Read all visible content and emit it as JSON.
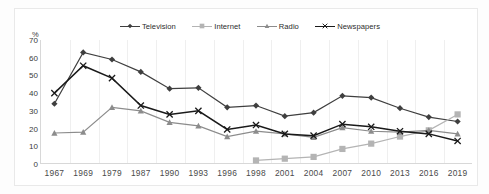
{
  "chart_data": {
    "type": "line",
    "title": "",
    "xlabel": "",
    "ylabel": "%",
    "ylim": [
      0,
      70
    ],
    "yticks": [
      70,
      60,
      50,
      40,
      30,
      20,
      10,
      0
    ],
    "grid": "vertical",
    "legend_position": "top-center",
    "categories": [
      "1967",
      "1969",
      "1979",
      "1987",
      "1990",
      "1993",
      "1996",
      "1998",
      "2001",
      "2004",
      "2007",
      "2010",
      "2013",
      "2016",
      "2019"
    ],
    "series": [
      {
        "name": "Television",
        "color": "#3f3f3f",
        "marker": "diamond",
        "values": [
          34,
          63,
          59,
          52,
          42.5,
          43,
          32,
          33,
          27,
          29,
          38.5,
          37.5,
          31.5,
          26.5,
          24
        ]
      },
      {
        "name": "Internet",
        "color": "#b4b4b4",
        "marker": "square",
        "values": [
          null,
          null,
          null,
          null,
          null,
          null,
          null,
          2,
          3,
          4,
          8.5,
          11.5,
          15.5,
          19,
          28
        ]
      },
      {
        "name": "Radio",
        "color": "#8c8c8c",
        "marker": "triangle",
        "values": [
          17.5,
          18,
          32,
          30,
          23.5,
          21.5,
          15.5,
          18.5,
          17,
          15,
          20.5,
          18.5,
          18,
          19,
          17
        ]
      },
      {
        "name": "Newspapers",
        "color": "#1a1a1a",
        "marker": "cross",
        "values": [
          40,
          55.5,
          48.5,
          33,
          28,
          30,
          19.5,
          22,
          17,
          16,
          22.5,
          21,
          18.5,
          17,
          13
        ]
      }
    ]
  },
  "legend": {
    "items": [
      {
        "label": "Television"
      },
      {
        "label": "Internet"
      },
      {
        "label": "Radio"
      },
      {
        "label": "Newspapers"
      }
    ]
  },
  "axes": {
    "y_unit_label": "%"
  }
}
